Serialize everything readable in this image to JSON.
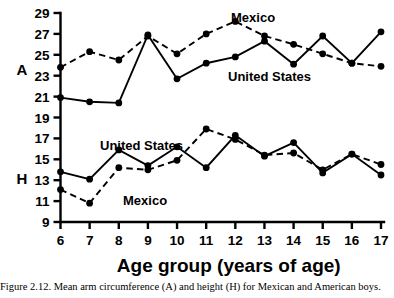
{
  "chart_data": {
    "type": "line",
    "title": "",
    "xlabel": "Age group (years of age)",
    "ylabel": "",
    "categories": [
      6,
      7,
      8,
      9,
      10,
      11,
      12,
      13,
      14,
      15,
      16,
      17
    ],
    "xlim": [
      5.5,
      17.5
    ],
    "ylim": [
      9,
      29
    ],
    "ytick_values": [
      9,
      11,
      13,
      15,
      17,
      19,
      21,
      23,
      25,
      27,
      29
    ],
    "xtick_labels": [
      "6",
      "7",
      "8",
      "9",
      "10",
      "11",
      "12",
      "13",
      "14",
      "15",
      "16",
      "17"
    ],
    "ytick_labels": [
      "9",
      "11",
      "13",
      "15",
      "17",
      "19",
      "21",
      "23",
      "25",
      "27",
      "29"
    ],
    "grid": false,
    "legend_position": "inline-annotations",
    "row_labels": [
      {
        "key": "A",
        "label": "A",
        "value_at": 23.6
      },
      {
        "key": "H",
        "label": "H",
        "value_at": 13.2
      }
    ],
    "series": [
      {
        "name": "Mexico",
        "group": "A",
        "style": "dashed",
        "marker": "filled-circle",
        "values": [
          23.8,
          25.3,
          24.5,
          26.8,
          25.1,
          27.0,
          28.2,
          26.8,
          26.0,
          25.1,
          24.2,
          23.9
        ]
      },
      {
        "name": "United States",
        "group": "A",
        "style": "solid",
        "marker": "filled-circle",
        "values": [
          20.9,
          20.5,
          20.4,
          26.9,
          22.7,
          24.2,
          24.8,
          26.3,
          24.1,
          26.8,
          24.2,
          27.2
        ]
      },
      {
        "name": "United States",
        "group": "H",
        "style": "solid",
        "marker": "filled-circle",
        "values": [
          13.8,
          13.1,
          15.9,
          14.4,
          16.2,
          14.2,
          17.3,
          15.3,
          16.6,
          13.7,
          15.5,
          13.5
        ]
      },
      {
        "name": "Mexico",
        "group": "H",
        "style": "dashed",
        "marker": "filled-circle",
        "values": [
          12.1,
          10.8,
          14.2,
          14.0,
          14.9,
          17.9,
          16.9,
          15.4,
          15.6,
          14.0,
          15.5,
          14.5
        ]
      }
    ],
    "annotations": [
      {
        "text": "Mexico",
        "group": "A",
        "x": 231,
        "y": 22
      },
      {
        "text": "United States",
        "group": "A",
        "x": 228,
        "y": 81
      },
      {
        "text": "United States",
        "group": "H",
        "x": 100,
        "y": 150
      },
      {
        "text": "Mexico",
        "group": "H",
        "x": 123,
        "y": 205
      }
    ]
  },
  "caption": {
    "text": "Figure  2.12.  Mean  arm  circumference  (A)  and  height  (H)  for  Mexican  and  American  boys."
  }
}
